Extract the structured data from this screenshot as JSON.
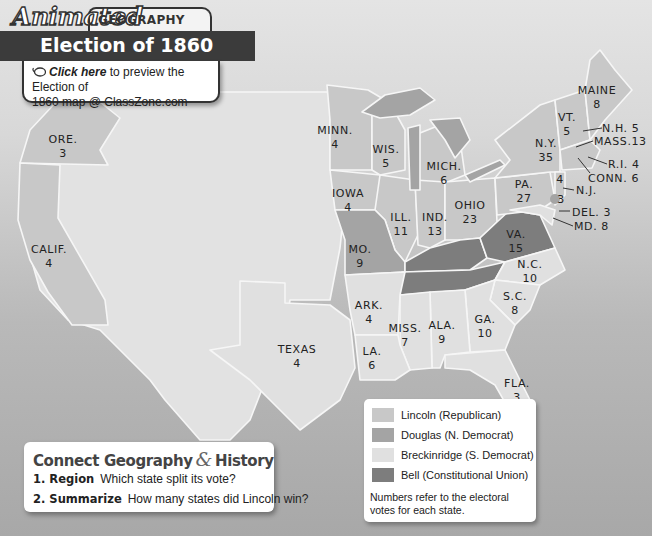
{
  "header": {
    "brand_word": "Animated",
    "brand_tag": "GEOGRAPHY",
    "title": "Election of 1860",
    "link_icon": "mouse-icon",
    "link_emph": "Click here",
    "link_rest_1": " to preview the Election of",
    "link_rest_2": "1860 map @ ClassZone.com"
  },
  "colors": {
    "lincoln": "#c8c8c8",
    "douglas": "#a4a4a4",
    "breckinridge": "#e0e0e0",
    "bell": "#7d7d7d",
    "ocean_top": "#e4e4e4",
    "ocean_bottom": "#a8a8a8",
    "territory": "#e2e2e2",
    "header_bar": "#3b3b3b"
  },
  "legend": {
    "items": [
      {
        "label": "Lincoln (Republican)",
        "color_key": "lincoln"
      },
      {
        "label": "Douglas (N. Democrat)",
        "color_key": "douglas"
      },
      {
        "label": "Breckinridge (S. Democrat)",
        "color_key": "breckinridge"
      },
      {
        "label": "Bell (Constitutional Union)",
        "color_key": "bell"
      }
    ],
    "note": "Numbers refer to the electoral votes for each state."
  },
  "states": {
    "maine": {
      "name": "MAINE",
      "votes": "8",
      "winner": "lincoln"
    },
    "vt": {
      "name": "VT.",
      "votes": "5",
      "winner": "lincoln"
    },
    "nh": {
      "name": "N.H. 5",
      "winner": "lincoln"
    },
    "mass": {
      "name": "MASS.13",
      "winner": "lincoln"
    },
    "ri": {
      "name": "R.I. 4",
      "winner": "lincoln"
    },
    "conn": {
      "name": "CONN. 6",
      "winner": "lincoln"
    },
    "ny": {
      "name": "N.Y.",
      "votes": "35",
      "winner": "lincoln"
    },
    "nj": {
      "name": "N.J.",
      "votes_lincoln": "4",
      "votes_douglas": "3",
      "winner": "split"
    },
    "pa": {
      "name": "PA.",
      "votes": "27",
      "winner": "lincoln"
    },
    "del": {
      "name": "DEL. 3",
      "winner": "breckinridge"
    },
    "md": {
      "name": "MD. 8",
      "winner": "breckinridge"
    },
    "va": {
      "name": "VA.",
      "votes": "15",
      "winner": "bell"
    },
    "ky": {
      "name": "KY.",
      "votes": "12",
      "winner": "bell"
    },
    "tenn": {
      "name": "TENN. 12",
      "winner": "bell"
    },
    "nc": {
      "name": "N.C.",
      "votes": "10",
      "winner": "breckinridge"
    },
    "sc": {
      "name": "S.C.",
      "votes": "8",
      "winner": "breckinridge"
    },
    "ga": {
      "name": "GA.",
      "votes": "10",
      "winner": "breckinridge"
    },
    "fla": {
      "name": "FLA.",
      "votes": "3",
      "winner": "breckinridge"
    },
    "ala": {
      "name": "ALA.",
      "votes": "9",
      "winner": "breckinridge"
    },
    "miss": {
      "name": "MISS.",
      "votes": "7",
      "winner": "breckinridge"
    },
    "la": {
      "name": "LA.",
      "votes": "6",
      "winner": "breckinridge"
    },
    "ark": {
      "name": "ARK.",
      "votes": "4",
      "winner": "breckinridge"
    },
    "texas": {
      "name": "TEXAS",
      "votes": "4",
      "winner": "breckinridge"
    },
    "mo": {
      "name": "MO.",
      "votes": "9",
      "winner": "douglas"
    },
    "ill": {
      "name": "ILL.",
      "votes": "11",
      "winner": "lincoln"
    },
    "ind": {
      "name": "IND.",
      "votes": "13",
      "winner": "lincoln"
    },
    "ohio": {
      "name": "OHIO",
      "votes": "23",
      "winner": "lincoln"
    },
    "mich": {
      "name": "MICH.",
      "votes": "6",
      "winner": "lincoln"
    },
    "wis": {
      "name": "WIS.",
      "votes": "5",
      "winner": "lincoln"
    },
    "minn": {
      "name": "MINN.",
      "votes": "4",
      "winner": "lincoln"
    },
    "iowa": {
      "name": "IOWA",
      "votes": "4",
      "winner": "lincoln"
    },
    "ore": {
      "name": "ORE.",
      "votes": "3",
      "winner": "lincoln"
    },
    "calif": {
      "name": "CALIF.",
      "votes": "4",
      "winner": "lincoln"
    }
  },
  "connect": {
    "title_a": "Connect Geography",
    "amp": "&",
    "title_b": "History",
    "questions": [
      {
        "num": "1. Region",
        "text": "Which state split its vote?"
      },
      {
        "num": "2. Summarize",
        "text": "How many states did Lincoln win?"
      }
    ]
  }
}
